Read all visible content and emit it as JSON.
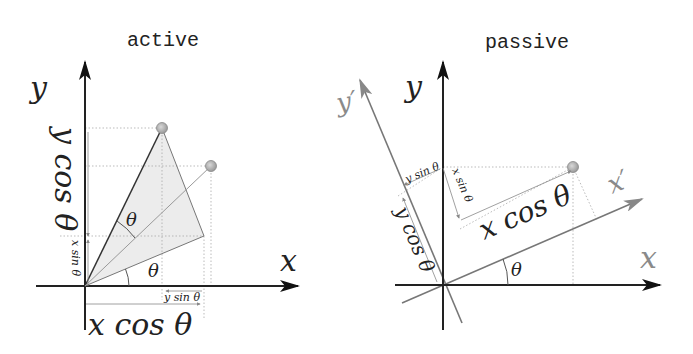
{
  "active": {
    "title": "active",
    "axis_x_label": "x",
    "axis_y_label": "y",
    "angle_label_upper": "θ",
    "angle_label_lower": "θ",
    "dim_x_cos": "x cos θ",
    "dim_y_cos": "y cos θ",
    "dim_x_sin": "x sin θ",
    "dim_y_sin": "y sin θ"
  },
  "passive": {
    "title": "passive",
    "axis_x_label": "x",
    "axis_y_label": "y",
    "axis_xp_label": "x′",
    "axis_yp_label": "y′",
    "angle_label": "θ",
    "dim_x_cos": "x cos θ",
    "dim_y_cos": "y cos θ",
    "dim_x_sin": "x sin θ",
    "dim_y_sin": "y sin θ"
  },
  "colors": {
    "axis": "#222222",
    "rotated_axis": "#777777",
    "triangle_fill": "#ececec",
    "point": "#b0b0b0"
  }
}
